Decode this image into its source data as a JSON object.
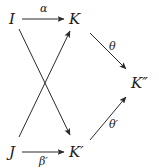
{
  "diagram": {
    "type": "commutative-diagram",
    "nodes": [
      {
        "id": "I",
        "label": "I"
      },
      {
        "id": "K",
        "label": "K"
      },
      {
        "id": "J",
        "label": "J"
      },
      {
        "id": "Kp",
        "label": "K′"
      },
      {
        "id": "Kpp",
        "label": "K″"
      }
    ],
    "edges": [
      {
        "from": "I",
        "to": "K",
        "label": "α"
      },
      {
        "from": "I",
        "to": "Kp",
        "label": ""
      },
      {
        "from": "J",
        "to": "K",
        "label": ""
      },
      {
        "from": "J",
        "to": "Kp",
        "label": "β′"
      },
      {
        "from": "K",
        "to": "Kpp",
        "label": "θ"
      },
      {
        "from": "Kp",
        "to": "Kpp",
        "label": "θ′"
      }
    ]
  },
  "labels": {
    "I": "I",
    "K": "K",
    "J": "J",
    "Kp": "K′",
    "Kpp": "K″",
    "alpha": "α",
    "beta_p": "β′",
    "theta": "θ",
    "theta_p": "θ′"
  }
}
